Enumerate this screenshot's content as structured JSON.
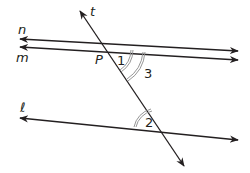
{
  "diagram": {
    "lines": [
      {
        "id": "t",
        "label": "t",
        "type": "transversal"
      },
      {
        "id": "n",
        "label": "n"
      },
      {
        "id": "m",
        "label": "m"
      },
      {
        "id": "l",
        "label": "ℓ"
      }
    ],
    "points": [
      {
        "id": "P",
        "label": "P"
      }
    ],
    "angles": [
      {
        "id": "1",
        "label": "1",
        "arcs": 2
      },
      {
        "id": "3",
        "label": "3",
        "arcs": 2
      },
      {
        "id": "2",
        "label": "2",
        "arcs": 2
      }
    ],
    "colors": {
      "line": "#231f20",
      "arc": "#8a8a8a",
      "background": "#ffffff"
    }
  }
}
